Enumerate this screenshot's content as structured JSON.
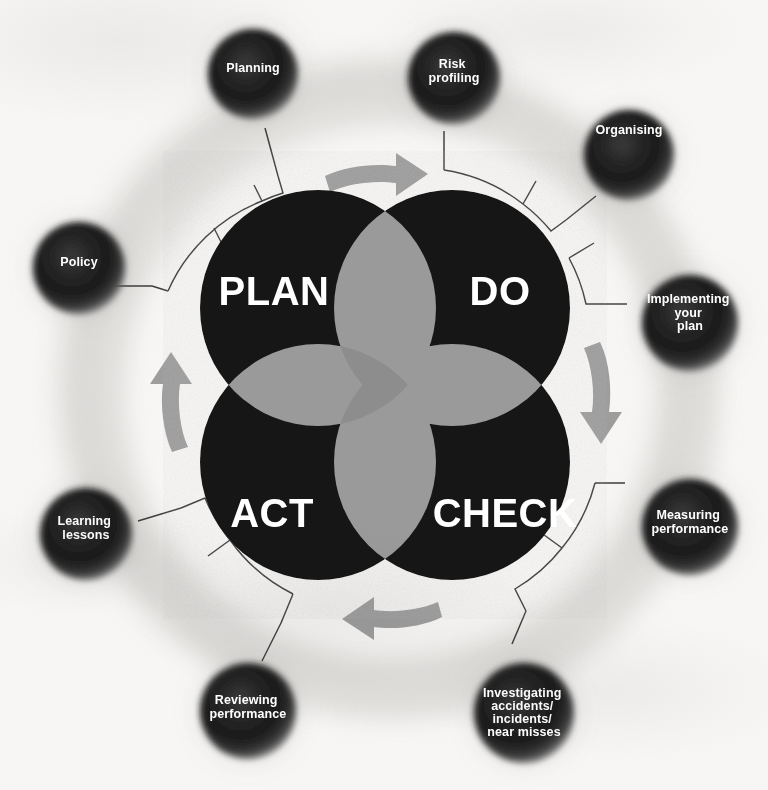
{
  "diagram": {
    "type": "cycle-venn",
    "direction": "clockwise",
    "colors": {
      "background": "#f7f6f4",
      "circle_fill": "#161616",
      "petal_fill": "#9a9a9a",
      "arrow_fill": "#9d9d9d",
      "sphere_core": "#1a1a1a",
      "sphere_edge": "#6f6f6f",
      "ring_stroke": "#3a3a3a",
      "label_text": "#ffffff",
      "halo": "#d7d6d4"
    },
    "core": {
      "quadrants": [
        {
          "id": "plan",
          "label": "PLAN",
          "position": "top-left"
        },
        {
          "id": "do",
          "label": "DO",
          "position": "top-right"
        },
        {
          "id": "act",
          "label": "ACT",
          "position": "bottom-left"
        },
        {
          "id": "check",
          "label": "CHECK",
          "position": "bottom-right"
        }
      ]
    },
    "arrows": [
      {
        "id": "arrow-top",
        "direction": "right",
        "meaning": "plan-to-do"
      },
      {
        "id": "arrow-right",
        "direction": "down",
        "meaning": "do-to-check"
      },
      {
        "id": "arrow-bottom",
        "direction": "left",
        "meaning": "check-to-act"
      },
      {
        "id": "arrow-left",
        "direction": "up",
        "meaning": "act-to-plan"
      }
    ],
    "nodes": [
      {
        "id": "policy",
        "lines": [
          "Policy"
        ],
        "angle_deg": 198,
        "stage": "plan"
      },
      {
        "id": "planning",
        "lines": [
          "Planning"
        ],
        "angle_deg": 252,
        "stage": "plan"
      },
      {
        "id": "risk-profiling",
        "lines": [
          "Risk",
          "profiling"
        ],
        "angle_deg": 287,
        "stage": "plan"
      },
      {
        "id": "organising",
        "lines": [
          "Organising"
        ],
        "angle_deg": 318,
        "stage": "do"
      },
      {
        "id": "implementing-your-plan",
        "lines": [
          "Implementing",
          "your",
          "plan"
        ],
        "angle_deg": 353,
        "stage": "do"
      },
      {
        "id": "measuring-performance",
        "lines": [
          "Measuring",
          "performance"
        ],
        "angle_deg": 28,
        "stage": "check"
      },
      {
        "id": "investigating-accidents",
        "lines": [
          "Investigating",
          "accidents/",
          "incidents/",
          "near misses"
        ],
        "angle_deg": 62,
        "stage": "check"
      },
      {
        "id": "reviewing-performance",
        "lines": [
          "Reviewing",
          "performance"
        ],
        "angle_deg": 105,
        "stage": "act"
      },
      {
        "id": "learning-lessons",
        "lines": [
          "Learning",
          "lessons"
        ],
        "angle_deg": 150,
        "stage": "act"
      }
    ]
  }
}
